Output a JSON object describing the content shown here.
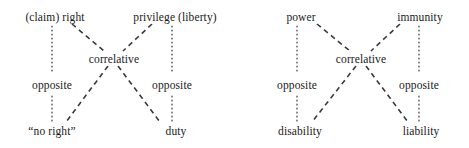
{
  "figure": {
    "background_color": "#ffffff",
    "text_color": "#1a1a1a",
    "line_color": "#3b3b3b",
    "diagrams": [
      {
        "name": "first-order-jural-relations",
        "nodes": {
          "top_left": "(claim) right",
          "top_right": "privilege (liberty)",
          "bottom_left": "“no right”",
          "bottom_right": "duty"
        },
        "relations": {
          "center": "correlative",
          "left_side": "opposite",
          "right_side": "opposite"
        }
      },
      {
        "name": "second-order-jural-relations",
        "nodes": {
          "top_left": "power",
          "top_right": "immunity",
          "bottom_left": "disability",
          "bottom_right": "liability"
        },
        "relations": {
          "center": "correlative",
          "left_side": "opposite",
          "right_side": "opposite"
        }
      }
    ]
  }
}
